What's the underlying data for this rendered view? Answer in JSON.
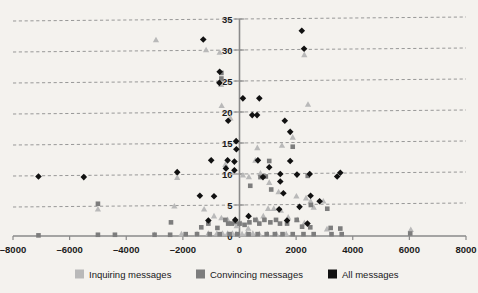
{
  "chart_data": {
    "type": "scatter",
    "title": "",
    "subtitle": "",
    "xlabel": "",
    "ylabel": "",
    "xlim": [
      -8000,
      8000
    ],
    "ylim": [
      0,
      35
    ],
    "xticks": [
      -8000,
      -6000,
      -4000,
      -2000,
      0,
      2000,
      4000,
      6000,
      8000
    ],
    "xtick_labels": [
      "–8000",
      "–6000",
      "–4000",
      "–2000",
      "0",
      "2000",
      "4000",
      "6000",
      "8000"
    ],
    "yticks": [
      0,
      5,
      10,
      15,
      20,
      25,
      30,
      35
    ],
    "ytick_labels": [
      "0",
      "5",
      "10",
      "15",
      "20",
      "25",
      "30",
      "35"
    ],
    "grid": {
      "horizontal": true,
      "vertical": false,
      "style": "dashed",
      "color": "#8d8d8d"
    },
    "axis_color": "#8a8a8a",
    "legend": {
      "position": "bottom",
      "entries": [
        {
          "name": "Inquiring messages",
          "marker": "triangle",
          "color": "#b9b9b9"
        },
        {
          "name": "Convincing messages",
          "marker": "square",
          "color": "#7d7d7d"
        },
        {
          "name": "All messages",
          "marker": "diamond",
          "color": "#111111"
        }
      ]
    },
    "series": [
      {
        "name": "Inquiring messages",
        "marker": "triangle",
        "color": "#b9b9b9",
        "points": [
          [
            -2950,
            31.6
          ],
          [
            -1180,
            30.0
          ],
          [
            -700,
            29.6
          ],
          [
            -650,
            24.4
          ],
          [
            -630,
            21.0
          ],
          [
            -320,
            19.0
          ],
          [
            -110,
            15.3
          ],
          [
            2290,
            29.2
          ],
          [
            2420,
            21.2
          ],
          [
            1880,
            15.9
          ],
          [
            1500,
            14.6
          ],
          [
            630,
            14.2
          ],
          [
            560,
            12.2
          ],
          [
            -500,
            11.5
          ],
          [
            -2200,
            9.4
          ],
          [
            -200,
            10.2
          ],
          [
            120,
            9.8
          ],
          [
            330,
            9.5
          ],
          [
            740,
            10.1
          ],
          [
            1050,
            8.6
          ],
          [
            1380,
            7.1
          ],
          [
            2010,
            6.4
          ],
          [
            2350,
            6.1
          ],
          [
            2510,
            5.6
          ],
          [
            2960,
            5.6
          ],
          [
            -5000,
            4.3
          ],
          [
            -2300,
            4.8
          ],
          [
            -1250,
            4.3
          ],
          [
            -900,
            3.2
          ],
          [
            -640,
            2.9
          ],
          [
            -420,
            2.6
          ],
          [
            -200,
            2.1
          ],
          [
            -100,
            1.6
          ],
          [
            60,
            2.0
          ],
          [
            310,
            1.2
          ],
          [
            610,
            2.6
          ],
          [
            840,
            3.2
          ],
          [
            1010,
            4.4
          ],
          [
            1210,
            4.4
          ],
          [
            1460,
            4.1
          ],
          [
            1720,
            3.0
          ],
          [
            2040,
            2.6
          ],
          [
            2290,
            2.1
          ],
          [
            2620,
            4.6
          ],
          [
            3090,
            1.1
          ],
          [
            -3000,
            0.2
          ],
          [
            -2050,
            0.3
          ],
          [
            -1500,
            0.3
          ],
          [
            -1100,
            0.4
          ],
          [
            -800,
            0.4
          ],
          [
            -600,
            0.4
          ],
          [
            -420,
            0.4
          ],
          [
            -250,
            0.4
          ],
          [
            -120,
            0.3
          ],
          [
            90,
            0.3
          ],
          [
            250,
            0.4
          ],
          [
            470,
            0.4
          ],
          [
            700,
            0.3
          ],
          [
            980,
            0.3
          ],
          [
            1300,
            0.3
          ],
          [
            1650,
            0.3
          ],
          [
            6050,
            1.0
          ]
        ]
      },
      {
        "name": "Convincing messages",
        "marker": "square",
        "color": "#7d7d7d",
        "points": [
          [
            -640,
            26.3
          ],
          [
            -640,
            25.4
          ],
          [
            1880,
            14.4
          ],
          [
            1050,
            12.1
          ],
          [
            930,
            9.6
          ],
          [
            740,
            9.5
          ],
          [
            380,
            8.1
          ],
          [
            1120,
            7.5
          ],
          [
            2410,
            9.7
          ],
          [
            2520,
            5.0
          ],
          [
            3100,
            4.4
          ],
          [
            -5000,
            5.2
          ],
          [
            -2420,
            2.2
          ],
          [
            -1350,
            1.4
          ],
          [
            -1100,
            2.0
          ],
          [
            -780,
            1.3
          ],
          [
            -500,
            2.6
          ],
          [
            -400,
            2.0
          ],
          [
            -270,
            2.0
          ],
          [
            -150,
            2.3
          ],
          [
            0,
            2.0
          ],
          [
            180,
            1.8
          ],
          [
            350,
            2.2
          ],
          [
            560,
            2.6
          ],
          [
            700,
            2.0
          ],
          [
            880,
            2.6
          ],
          [
            1090,
            2.2
          ],
          [
            1290,
            2.6
          ],
          [
            1430,
            2.0
          ],
          [
            1680,
            2.0
          ],
          [
            2020,
            2.6
          ],
          [
            2210,
            1.5
          ],
          [
            2500,
            1.4
          ],
          [
            3220,
            1.3
          ],
          [
            3560,
            1.2
          ],
          [
            -7100,
            0.1
          ],
          [
            -5000,
            0.2
          ],
          [
            -4400,
            0.2
          ],
          [
            -3000,
            0.2
          ],
          [
            -2450,
            0.2
          ],
          [
            -1900,
            0.3
          ],
          [
            -1500,
            0.3
          ],
          [
            -1050,
            0.3
          ],
          [
            -700,
            0.3
          ],
          [
            -350,
            0.3
          ],
          [
            -80,
            0.3
          ],
          [
            320,
            0.3
          ],
          [
            640,
            0.3
          ],
          [
            960,
            0.3
          ],
          [
            1250,
            0.3
          ],
          [
            1520,
            0.3
          ],
          [
            1880,
            0.3
          ],
          [
            2260,
            0.3
          ],
          [
            2620,
            0.3
          ],
          [
            3250,
            0.3
          ],
          [
            3610,
            0.3
          ],
          [
            6030,
            0.4
          ]
        ]
      },
      {
        "name": "All messages",
        "marker": "diamond",
        "color": "#111111",
        "points": [
          [
            2200,
            33.1
          ],
          [
            -1280,
            31.7
          ],
          [
            2280,
            30.2
          ],
          [
            -700,
            26.5
          ],
          [
            -710,
            24.7
          ],
          [
            120,
            22.2
          ],
          [
            700,
            22.2
          ],
          [
            450,
            19.5
          ],
          [
            620,
            19.5
          ],
          [
            -400,
            18.6
          ],
          [
            1600,
            18.6
          ],
          [
            1790,
            16.8
          ],
          [
            -120,
            15.3
          ],
          [
            -110,
            14.0
          ],
          [
            -1000,
            12.2
          ],
          [
            -420,
            12.2
          ],
          [
            -180,
            12.0
          ],
          [
            650,
            12.2
          ],
          [
            1790,
            12.1
          ],
          [
            -480,
            10.9
          ],
          [
            -180,
            10.6
          ],
          [
            -2200,
            10.3
          ],
          [
            -5500,
            9.5
          ],
          [
            -7100,
            9.6
          ],
          [
            1050,
            11.1
          ],
          [
            1440,
            10.0
          ],
          [
            2480,
            10.0
          ],
          [
            3560,
            10.2
          ],
          [
            2030,
            9.9
          ],
          [
            1440,
            8.8
          ],
          [
            830,
            9.5
          ],
          [
            -1400,
            6.5
          ],
          [
            -900,
            6.4
          ],
          [
            1550,
            6.9
          ],
          [
            2510,
            6.5
          ],
          [
            2830,
            5.6
          ],
          [
            3450,
            9.6
          ],
          [
            2120,
            4.7
          ],
          [
            1400,
            4.3
          ],
          [
            320,
            3.2
          ],
          [
            -150,
            2.6
          ],
          [
            -1100,
            2.5
          ],
          [
            1680,
            2.5
          ],
          [
            2400,
            2.0
          ]
        ]
      }
    ]
  },
  "axes": {
    "x_axis_name": "horizontal-axis",
    "y_axis_name": "vertical-axis"
  }
}
